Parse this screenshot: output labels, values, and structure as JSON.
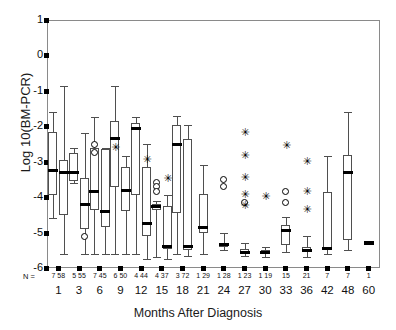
{
  "chart_data": {
    "type": "box",
    "title": "",
    "xlabel": "Months After Diagnosis",
    "ylabel": "Log 10(BM-PCR)",
    "ylim": [
      -6,
      1
    ],
    "yticks": [
      1,
      0,
      -1,
      -2,
      -3,
      -4,
      -5,
      -6
    ],
    "ytick_labels": [
      "1",
      "0",
      "-1",
      "-2",
      "-3",
      "-4",
      "-5",
      "-6"
    ],
    "grid": false,
    "legend": "none",
    "n_row_label": "N =",
    "categories": [
      "1",
      "3",
      "6",
      "9",
      "12",
      "15",
      "18",
      "21",
      "24",
      "27",
      "30",
      "33",
      "36",
      "42",
      "48",
      "60"
    ],
    "n_values": [
      "7 58",
      "5 55",
      "7 45",
      "6 50",
      "4 44",
      "4 37",
      "3 72",
      "1 29",
      "1 28",
      "1 23",
      "1 19",
      "15",
      "21",
      "7",
      "7",
      "1"
    ],
    "groups": [
      {
        "category": "1",
        "boxes": [
          {
            "whisker_low": -4.6,
            "q1": -3.95,
            "median": -3.25,
            "q3": -2.15,
            "whisker_high": -1.6,
            "outliers": [],
            "stars": []
          },
          {
            "whisker_low": -5.6,
            "q1": -4.5,
            "median": -3.3,
            "q3": -2.95,
            "whisker_high": -0.85,
            "outliers": [],
            "stars": []
          }
        ]
      },
      {
        "category": "3",
        "boxes": [
          {
            "whisker_low": -3.6,
            "q1": -3.55,
            "median": -3.3,
            "q3": -2.75,
            "whisker_high": -2.6,
            "outliers": [],
            "stars": []
          },
          {
            "whisker_low": -5.6,
            "q1": -4.9,
            "median": -4.2,
            "q3": -3.45,
            "whisker_high": -2.2,
            "outliers": [
              -5.1
            ],
            "stars": []
          }
        ]
      },
      {
        "category": "6",
        "boxes": [
          {
            "whisker_low": -5.6,
            "q1": -4.35,
            "median": -3.85,
            "q3": -2.6,
            "whisker_high": -1.75,
            "outliers": [
              -2.5,
              -2.75
            ],
            "stars": []
          },
          {
            "whisker_low": -5.6,
            "q1": -4.85,
            "median": -4.4,
            "q3": -2.65,
            "whisker_high": -2.6,
            "outliers": [],
            "stars": []
          }
        ]
      },
      {
        "category": "9",
        "boxes": [
          {
            "whisker_low": -5.6,
            "q1": -3.7,
            "median": -2.35,
            "q3": -1.85,
            "whisker_high": -0.85,
            "outliers": [],
            "stars": [
              -2.6
            ]
          },
          {
            "whisker_low": -5.6,
            "q1": -4.4,
            "median": -3.8,
            "q3": -3.15,
            "whisker_high": -2.85,
            "outliers": [],
            "stars": []
          }
        ]
      },
      {
        "category": "12",
        "boxes": [
          {
            "whisker_low": -5.6,
            "q1": -3.95,
            "median": -2.05,
            "q3": -1.9,
            "whisker_high": -1.75,
            "outliers": [],
            "stars": []
          },
          {
            "whisker_low": -5.75,
            "q1": -5.1,
            "median": -4.75,
            "q3": -3.15,
            "whisker_high": -2.5,
            "outliers": [],
            "stars": [
              -2.95
            ]
          }
        ]
      },
      {
        "category": "15",
        "boxes": [
          {
            "whisker_low": -5.7,
            "q1": -4.35,
            "median": -4.25,
            "q3": -4.2,
            "whisker_high": -4.1,
            "outliers": [
              -3.6,
              -3.7,
              -3.85
            ],
            "stars": []
          },
          {
            "whisker_low": -5.75,
            "q1": -5.45,
            "median": -5.4,
            "q3": -4.25,
            "whisker_high": -3.95,
            "outliers": [],
            "stars": [
              -3.5
            ]
          }
        ]
      },
      {
        "category": "18",
        "boxes": [
          {
            "whisker_low": -5.6,
            "q1": -4.45,
            "median": -2.5,
            "q3": -1.95,
            "whisker_high": -1.7,
            "outliers": [],
            "stars": []
          },
          {
            "whisker_low": -5.65,
            "q1": -5.5,
            "median": -5.4,
            "q3": -2.35,
            "whisker_high": -1.95,
            "outliers": [],
            "stars": []
          }
        ]
      },
      {
        "category": "21",
        "boxes": [
          {
            "whisker_low": -5.6,
            "q1": -5.0,
            "median": -4.85,
            "q3": -3.9,
            "whisker_high": -3.1,
            "outliers": [],
            "stars": []
          }
        ]
      },
      {
        "category": "24",
        "boxes": [
          {
            "whisker_low": -5.5,
            "q1": -5.4,
            "median": -5.35,
            "q3": -5.3,
            "whisker_high": -5.0,
            "outliers": [
              -3.5,
              -3.7
            ],
            "stars": []
          }
        ]
      },
      {
        "category": "27",
        "boxes": [
          {
            "whisker_low": -5.65,
            "q1": -5.6,
            "median": -5.55,
            "q3": -5.45,
            "whisker_high": -5.3,
            "outliers": [
              -4.15
            ],
            "stars": [
              -2.2,
              -2.85,
              -3.45,
              -3.95,
              -4.25
            ]
          }
        ]
      },
      {
        "category": "30",
        "boxes": [
          {
            "whisker_low": -5.7,
            "q1": -5.6,
            "median": -5.55,
            "q3": -5.5,
            "whisker_high": -5.4,
            "outliers": [],
            "stars": [
              -4.0
            ]
          }
        ]
      },
      {
        "category": "33",
        "boxes": [
          {
            "whisker_low": -5.55,
            "q1": -5.35,
            "median": -4.95,
            "q3": -4.8,
            "whisker_high": -4.55,
            "outliers": [
              -3.85,
              -4.15
            ],
            "stars": [
              -2.55
            ]
          }
        ]
      },
      {
        "category": "36",
        "boxes": [
          {
            "whisker_low": -5.7,
            "q1": -5.55,
            "median": -5.5,
            "q3": -5.4,
            "whisker_high": -5.1,
            "outliers": [],
            "stars": [
              -3.0,
              -3.85,
              -4.35
            ]
          }
        ]
      },
      {
        "category": "42",
        "boxes": [
          {
            "whisker_low": -5.6,
            "q1": -5.5,
            "median": -5.45,
            "q3": -3.85,
            "whisker_high": -2.85,
            "outliers": [],
            "stars": []
          }
        ]
      },
      {
        "category": "48",
        "boxes": [
          {
            "whisker_low": -5.5,
            "q1": -5.2,
            "median": -3.3,
            "q3": -2.8,
            "whisker_high": -1.6,
            "outliers": [],
            "stars": []
          }
        ]
      },
      {
        "category": "60",
        "boxes": [
          {
            "whisker_low": -5.3,
            "q1": -5.3,
            "median": -5.3,
            "q3": -5.3,
            "whisker_high": -5.3,
            "outliers": [],
            "stars": []
          }
        ]
      }
    ]
  }
}
